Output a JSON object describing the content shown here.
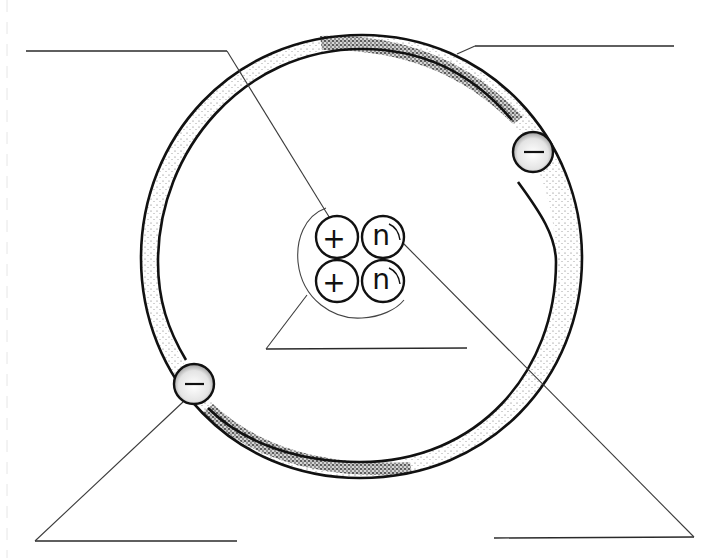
{
  "diagram": {
    "title": "",
    "colors": {
      "ink": "#111111",
      "shading": "#555555",
      "background": "#ffffff"
    },
    "nucleus": {
      "protons": [
        {
          "symbol": "+",
          "cx": 337,
          "cy": 237
        },
        {
          "symbol": "+",
          "cx": 337,
          "cy": 281
        }
      ],
      "neutrons": [
        {
          "symbol": "n",
          "cx": 383,
          "cy": 237
        },
        {
          "symbol": "n",
          "cx": 383,
          "cy": 281
        }
      ],
      "particle_radius": 21
    },
    "electrons": [
      {
        "symbol": "−",
        "cx": 533,
        "cy": 152,
        "radius": 20
      },
      {
        "symbol": "−",
        "cx": 194,
        "cy": 384,
        "radius": 20
      }
    ],
    "labels": [
      {
        "id": "label-top-left",
        "text": "",
        "points_to": "proton"
      },
      {
        "id": "label-top-right",
        "text": "",
        "points_to": "electron-orbit"
      },
      {
        "id": "label-center",
        "text": "",
        "points_to": "nucleus"
      },
      {
        "id": "label-bottom-left",
        "text": "",
        "points_to": "electron"
      },
      {
        "id": "label-bottom-right",
        "text": "",
        "points_to": "neutron"
      }
    ]
  }
}
